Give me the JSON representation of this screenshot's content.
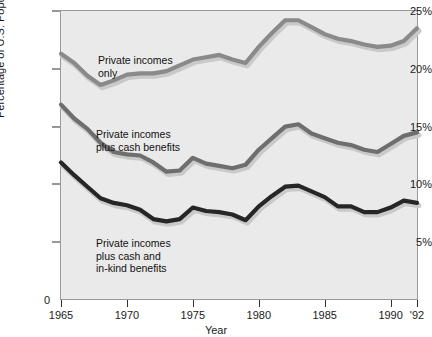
{
  "top_truncated_text": "—  —  —  —  —  —  —  —  —  —",
  "axes": {
    "ylabel": "Percentage of U.S. Population in Poverty",
    "xlabel": "Year",
    "zero_label": "0",
    "yticks": [
      "5%",
      "10%",
      "15%",
      "20%",
      "25%"
    ],
    "xticks": [
      "1965",
      "1970",
      "1975",
      "1980",
      "1985",
      "1990",
      "'92"
    ]
  },
  "annotations": {
    "private_only": "Private incomes\nonly",
    "plus_cash": "Private incomes\nplus cash benefits",
    "plus_cash_inkind": "Private incomes\nplus cash and\nin-kind benefits"
  },
  "colors": {
    "plot_background": "#eaeaea",
    "frame": "#9a9a9a",
    "series_private_only": "#8a8a8a",
    "series_plus_cash": "#6e6e6e",
    "series_plus_cash_inkind": "#262626",
    "shadow": "#c9c9c9",
    "text": "#1a1a1a"
  },
  "chart_data": {
    "type": "line",
    "title": "",
    "xlabel": "Year",
    "ylabel": "Percentage of U.S. Population in Poverty",
    "xlim": [
      1965,
      1992
    ],
    "ylim": [
      0,
      25
    ],
    "ytick_values": [
      5,
      10,
      15,
      20,
      25
    ],
    "xtick_values": [
      1965,
      1970,
      1975,
      1980,
      1985,
      1990,
      1992
    ],
    "grid": false,
    "legend": "inline-annotations",
    "x": [
      1965,
      1966,
      1967,
      1968,
      1969,
      1970,
      1971,
      1972,
      1973,
      1974,
      1975,
      1976,
      1977,
      1978,
      1979,
      1980,
      1981,
      1982,
      1983,
      1984,
      1985,
      1986,
      1987,
      1988,
      1989,
      1990,
      1991,
      1992
    ],
    "series": [
      {
        "name": "Private incomes only",
        "color": "#8a8a8a",
        "values": [
          21.3,
          20.5,
          19.4,
          18.6,
          19.0,
          19.5,
          19.6,
          19.6,
          19.8,
          20.3,
          20.8,
          21.0,
          21.2,
          20.8,
          20.5,
          21.9,
          23.1,
          24.2,
          24.2,
          23.6,
          23.0,
          22.6,
          22.4,
          22.1,
          21.9,
          22.0,
          22.4,
          23.5
        ]
      },
      {
        "name": "Private incomes plus cash benefits",
        "color": "#6e6e6e",
        "values": [
          16.9,
          15.7,
          14.8,
          13.6,
          12.8,
          12.6,
          12.5,
          11.9,
          11.1,
          11.2,
          12.3,
          11.8,
          11.6,
          11.4,
          11.7,
          13.0,
          14.0,
          15.0,
          15.2,
          14.4,
          14.0,
          13.6,
          13.4,
          13.0,
          12.8,
          13.5,
          14.2,
          14.5
        ]
      },
      {
        "name": "Private incomes plus cash and in-kind benefits",
        "color": "#262626",
        "values": [
          11.9,
          10.8,
          9.8,
          8.8,
          8.4,
          8.2,
          7.8,
          7.0,
          6.8,
          7.0,
          8.0,
          7.7,
          7.6,
          7.4,
          6.9,
          8.1,
          9.0,
          9.8,
          9.9,
          9.4,
          8.9,
          8.1,
          8.1,
          7.6,
          7.6,
          8.0,
          8.6,
          8.4
        ]
      }
    ]
  }
}
